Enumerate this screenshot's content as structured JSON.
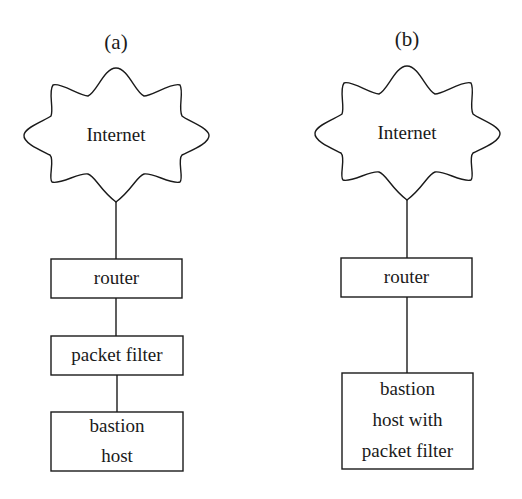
{
  "diagram": {
    "panels": [
      {
        "label": "(a)",
        "cloud": "Internet",
        "boxes": [
          "router",
          "packet filter",
          "bastion\nhost"
        ],
        "box_lines": {
          "router": "router",
          "packet_filter": "packet filter",
          "bastion_1": "bastion",
          "bastion_2": "host"
        }
      },
      {
        "label": "(b)",
        "cloud": "Internet",
        "boxes": [
          "router",
          "bastion\nhost with\npacket filter"
        ],
        "box_lines": {
          "router": "router",
          "bastion_1": "bastion",
          "bastion_2": "host with",
          "bastion_3": "packet filter"
        }
      }
    ],
    "colors": {
      "stroke": "#1a1a1a",
      "background": "#ffffff"
    }
  }
}
